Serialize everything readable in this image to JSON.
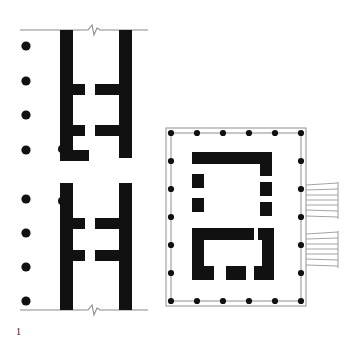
{
  "figure": {
    "caption_number": "1",
    "background_color": "#ffffff",
    "wall_fill_color": "#111111",
    "thin_line_color": "#8a8a8a",
    "column_dot_color": "#111111",
    "stair_line_color": "#9a9a9a"
  },
  "left_plan": {
    "name": "partial-colonnade-plan",
    "description": "Two stacked wall-segment plans separated by a gap, each bounded by a thin datum line with a zig-zag break symbol",
    "column_dots": {
      "label": "free-standing column positions",
      "count": 8,
      "radius": 4.6,
      "x": 26,
      "upper_group_y": [
        46,
        81,
        115,
        150
      ],
      "lower_group_y": [
        199,
        233,
        267,
        301
      ]
    },
    "break_lines": [
      {
        "name": "upper-datum-break-line",
        "y": 30,
        "x1": 20,
        "x2": 148,
        "break_x": 94
      },
      {
        "name": "lower-datum-break-line",
        "y": 310,
        "x1": 20,
        "x2": 148,
        "break_x": 94
      }
    ],
    "upper_segment": {
      "name": "upper-wall-segment",
      "outer_left_wall": {
        "x": 60,
        "y": 30,
        "w": 13,
        "h": 128
      },
      "outer_right_wall": {
        "x": 119,
        "y": 30,
        "w": 13,
        "h": 128
      },
      "upper_cross_wall": {
        "x": 60,
        "y": 84,
        "w": 72,
        "h": 11,
        "gap_x": 85,
        "gap_w": 10
      },
      "lower_cross_wall": {
        "x": 60,
        "y": 125,
        "w": 72,
        "h": 11,
        "gap_x": 85,
        "gap_w": 10
      },
      "base_block": {
        "x": 60,
        "y": 150,
        "w": 29,
        "h": 11
      },
      "anta_dot": {
        "cx": 62,
        "cy": 149,
        "r": 4.0
      }
    },
    "lower_segment": {
      "name": "lower-wall-segment",
      "outer_left_wall": {
        "x": 60,
        "y": 183,
        "w": 13,
        "h": 127
      },
      "outer_right_wall": {
        "x": 119,
        "y": 183,
        "w": 13,
        "h": 127
      },
      "upper_cross_wall": {
        "x": 60,
        "y": 218,
        "w": 72,
        "h": 11,
        "gap_x": 85,
        "gap_w": 10
      },
      "lower_cross_wall": {
        "x": 60,
        "y": 250,
        "w": 72,
        "h": 11,
        "gap_x": 85,
        "gap_w": 10
      },
      "anta_dot": {
        "cx": 62,
        "cy": 201,
        "r": 4.0
      }
    }
  },
  "right_plan": {
    "name": "peripteral-temple-plan",
    "description": "Rectangular temple with peristyle of columns on all four sides, inner cella walls and two external stairways on the east flank",
    "stylobate": {
      "x": 166,
      "y": 128,
      "w": 140,
      "h": 178
    },
    "krepis": {
      "x": 171,
      "y": 133,
      "w": 130,
      "h": 168
    },
    "peristyle": {
      "label": "peristyle column grid",
      "dot_radius": 3.1,
      "top_row_y": 133,
      "bottom_row_y": 301,
      "left_col_x": 171,
      "right_col_x": 301,
      "top_row_x": [
        171,
        197,
        223,
        249,
        275,
        301
      ],
      "bottom_row_x": [
        171,
        197,
        223,
        249,
        275,
        301
      ],
      "left_col_y": [
        133,
        161,
        189,
        217,
        245,
        273,
        301
      ],
      "right_col_y": [
        133,
        161,
        189,
        217,
        245,
        273,
        301
      ],
      "column_count_long_side": 7,
      "column_count_short_side": 6
    },
    "cella_north": {
      "name": "north-cella-block",
      "parts": [
        {
          "name": "north-wall",
          "x": 192,
          "y": 152,
          "w": 80,
          "h": 12
        },
        {
          "name": "north-wall-return",
          "x": 260,
          "y": 152,
          "w": 12,
          "h": 22
        },
        {
          "name": "west-pier-upper",
          "x": 192,
          "y": 174,
          "w": 12,
          "h": 14
        },
        {
          "name": "west-pier-lower",
          "x": 192,
          "y": 198,
          "w": 12,
          "h": 14
        },
        {
          "name": "east-pier-upper",
          "x": 260,
          "y": 180,
          "w": 12,
          "h": 14
        },
        {
          "name": "east-pier-lower",
          "x": 260,
          "y": 202,
          "w": 12,
          "h": 14
        }
      ]
    },
    "cella_south": {
      "name": "south-cella-block",
      "parts": [
        {
          "name": "south-upper-wall",
          "x": 192,
          "y": 228,
          "w": 62,
          "h": 12
        },
        {
          "name": "south-upper-wall-east",
          "x": 258,
          "y": 228,
          "w": 16,
          "h": 12
        },
        {
          "name": "west-wall",
          "x": 192,
          "y": 228,
          "w": 12,
          "h": 52
        },
        {
          "name": "east-wall",
          "x": 262,
          "y": 240,
          "w": 12,
          "h": 40
        },
        {
          "name": "south-pier-west",
          "x": 192,
          "y": 266,
          "w": 22,
          "h": 14
        },
        {
          "name": "south-pier-mid",
          "x": 226,
          "y": 266,
          "w": 20,
          "h": 14
        },
        {
          "name": "south-pier-east",
          "x": 254,
          "y": 266,
          "w": 20,
          "h": 14
        }
      ]
    },
    "stairways": [
      {
        "name": "upper-stairway",
        "x": 306,
        "y": 185,
        "w": 32,
        "h": 34,
        "steps": 7,
        "label": "east upper stairway"
      },
      {
        "name": "lower-stairway",
        "x": 306,
        "y": 234,
        "w": 32,
        "h": 34,
        "steps": 7,
        "label": "east lower stairway"
      }
    ]
  }
}
